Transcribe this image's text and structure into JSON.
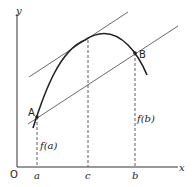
{
  "diagram": {
    "axes": {
      "x_label": "x",
      "y_label": "y",
      "origin_label": "O"
    },
    "ticks": [
      {
        "label": "a",
        "x": 37
      },
      {
        "label": "c",
        "x": 88
      },
      {
        "label": "b",
        "x": 135
      }
    ],
    "points": [
      {
        "label": "A",
        "x": 37,
        "y": 117
      },
      {
        "label": "B",
        "x": 135,
        "y": 53
      }
    ],
    "value_labels": {
      "fa": "f(a)",
      "fb": "f(b)"
    },
    "colors": {
      "curve": "#222222",
      "line": "#444444",
      "axis": "#333333"
    }
  }
}
